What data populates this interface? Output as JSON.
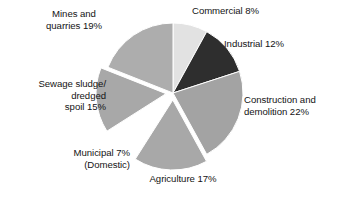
{
  "chart_data": {
    "type": "pie",
    "title": "",
    "subtitle": "",
    "xlabel": "",
    "ylabel": "",
    "legend_position": "none",
    "grid": false,
    "units": "percent",
    "total": 100,
    "start_angle_deg": 0,
    "direction": "clockwise",
    "center": {
      "x": 173,
      "y": 93
    },
    "radius": 70,
    "categories": [
      "Commercial",
      "Industrial",
      "Construction and demolition",
      "Agriculture",
      "Municipal (Domestic)",
      "Sewage sludge/dredged spoil",
      "Mines and quarries"
    ],
    "values": [
      8,
      12,
      22,
      17,
      7,
      15,
      19
    ],
    "slices": [
      {
        "name": "Commercial",
        "value": 8,
        "label": "Commercial 8%",
        "color": "#e2e2e2",
        "exploded": false,
        "start_deg": 0,
        "end_deg": 28.8
      },
      {
        "name": "Industrial",
        "value": 12,
        "label": "Industrial 12%",
        "color": "#2e2e2e",
        "exploded": false,
        "start_deg": 28.8,
        "end_deg": 72
      },
      {
        "name": "Construction and demolition",
        "value": 22,
        "label": "Construction and\ndemolition 22%",
        "color": "#a3a3a3",
        "exploded": false,
        "start_deg": 72,
        "end_deg": 151.2
      },
      {
        "name": "Agriculture",
        "value": 17,
        "label": "Agriculture 17%",
        "color": "#a8a8a8",
        "exploded": true,
        "start_deg": 151.2,
        "end_deg": 212.4
      },
      {
        "name": "Municipal (Domestic)",
        "value": 7,
        "label": "Municipal 7%\n(Domestic)",
        "color": "#ffffff",
        "exploded": false,
        "start_deg": 212.4,
        "end_deg": 237.6
      },
      {
        "name": "Sewage sludge/dredged spoil",
        "value": 15,
        "label": "Sewage sludge/\ndredged\nspoil 15%",
        "color": "#a8a8a8",
        "exploded": true,
        "start_deg": 237.6,
        "end_deg": 291.6
      },
      {
        "name": "Mines and quarries",
        "value": 19,
        "label": "Mines and\nquarries 19%",
        "color": "#adadad",
        "exploded": false,
        "start_deg": 291.6,
        "end_deg": 360
      }
    ]
  },
  "labels": {
    "mines": "Mines and\nquarries 19%",
    "sewage": "Sewage sludge/\ndredged\nspoil 15%",
    "municipal": "Municipal 7%\n(Domestic)",
    "agriculture": "Agriculture 17%",
    "commercial": "Commercial 8%",
    "industrial": "Industrial 12%",
    "construction": "Construction and\ndemolition 22%"
  },
  "style": {
    "background": "#ffffff",
    "text_color": "#141414",
    "slice_edge": "#ffffff"
  }
}
